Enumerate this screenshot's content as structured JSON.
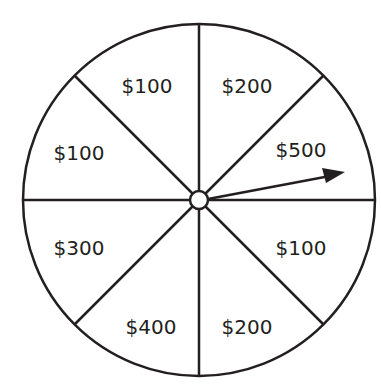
{
  "diagram": {
    "type": "spinner-wheel",
    "sections": [
      {
        "position": "top-left",
        "label": "$100"
      },
      {
        "position": "top-right",
        "label": "$200"
      },
      {
        "position": "right-upper",
        "label": "$500"
      },
      {
        "position": "right-lower",
        "label": "$100"
      },
      {
        "position": "bottom-right",
        "label": "$200"
      },
      {
        "position": "bottom-left",
        "label": "$400"
      },
      {
        "position": "left-lower",
        "label": "$300"
      },
      {
        "position": "left-upper",
        "label": "$100"
      }
    ],
    "pointer": {
      "points_to": "$500"
    },
    "colors": {
      "stroke": "#231f20",
      "fill": "#ffffff"
    }
  }
}
